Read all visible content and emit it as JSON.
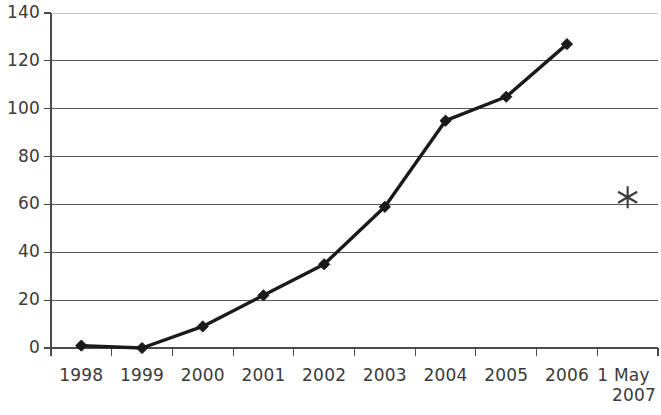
{
  "chart_data": {
    "type": "line",
    "title": "",
    "subtitle": "",
    "xlabel": "",
    "ylabel": "",
    "categories": [
      "1998",
      "1999",
      "2000",
      "2001",
      "2002",
      "2003",
      "2004",
      "2005",
      "2006",
      "1 May 2007"
    ],
    "series": [
      {
        "name": "main",
        "marker": "diamond",
        "color": "#1a1a1a",
        "values": [
          1,
          0,
          9,
          22,
          35,
          59,
          95,
          105,
          127,
          null
        ]
      },
      {
        "name": "projection",
        "marker": "asterisk",
        "color": "#3a3a3a",
        "values": [
          null,
          null,
          null,
          null,
          null,
          null,
          null,
          null,
          null,
          63
        ]
      }
    ],
    "ylim": [
      0,
      140
    ],
    "yticks": [
      0,
      20,
      40,
      60,
      80,
      100,
      120,
      140
    ],
    "ytick_labels": [
      "0",
      "20",
      "40",
      "60",
      "80",
      "100",
      "120",
      "140"
    ],
    "xtick_labels": [
      {
        "line1": "1998",
        "line2": ""
      },
      {
        "line1": "1999",
        "line2": ""
      },
      {
        "line1": "2000",
        "line2": ""
      },
      {
        "line1": "2001",
        "line2": ""
      },
      {
        "line1": "2002",
        "line2": ""
      },
      {
        "line1": "2003",
        "line2": ""
      },
      {
        "line1": "2004",
        "line2": ""
      },
      {
        "line1": "2005",
        "line2": ""
      },
      {
        "line1": "2006",
        "line2": ""
      },
      {
        "line1": "1 May",
        "line2": "2007"
      }
    ],
    "grid": true,
    "grid_axis": "y",
    "legend": false,
    "legend_position": "none",
    "gridline_color": "#555555",
    "axis_color": "#4a4a4a",
    "background_color": "#ffffff",
    "annotations": []
  }
}
